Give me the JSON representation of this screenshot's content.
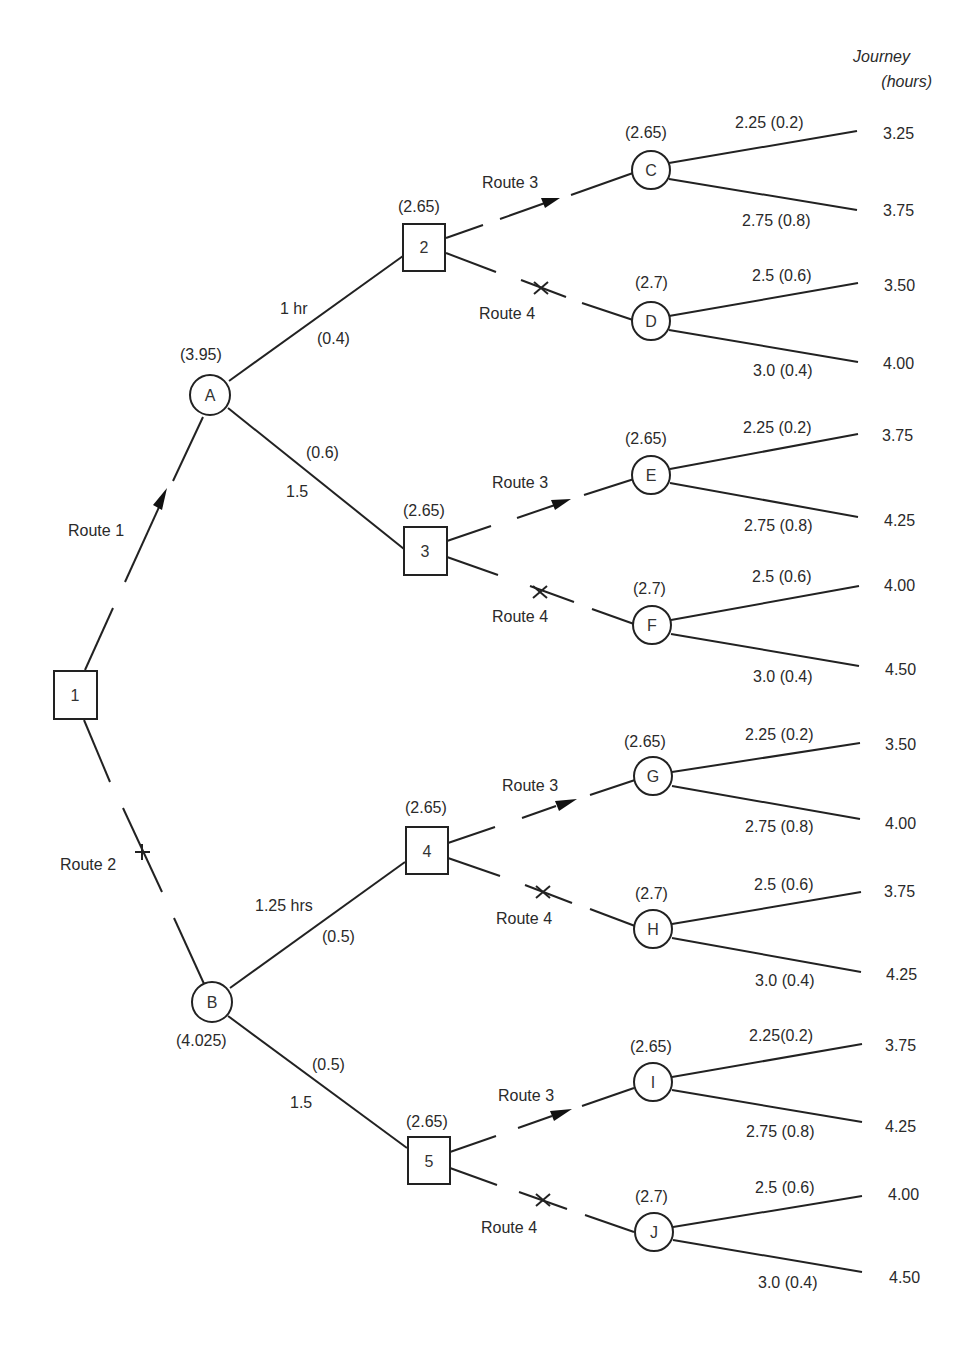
{
  "header": {
    "journey_label": "Journey",
    "hours_label": "(hours)"
  },
  "decision_nodes": [
    {
      "id": "1",
      "label": "1",
      "value": ""
    },
    {
      "id": "2",
      "label": "2",
      "value": "(2.65)"
    },
    {
      "id": "3",
      "label": "3",
      "value": "(2.65)"
    },
    {
      "id": "4",
      "label": "4",
      "value": "(2.65)"
    },
    {
      "id": "5",
      "label": "5",
      "value": "(2.65)"
    }
  ],
  "chance_nodes": [
    {
      "id": "A",
      "label": "A",
      "value": "(3.95)"
    },
    {
      "id": "B",
      "label": "B",
      "value": "(4.025)"
    },
    {
      "id": "C",
      "label": "C",
      "value": "(2.65)"
    },
    {
      "id": "D",
      "label": "D",
      "value": "(2.7)"
    },
    {
      "id": "E",
      "label": "E",
      "value": "(2.65)"
    },
    {
      "id": "F",
      "label": "F",
      "value": "(2.7)"
    },
    {
      "id": "G",
      "label": "G",
      "value": "(2.65)"
    },
    {
      "id": "H",
      "label": "H",
      "value": "(2.7)"
    },
    {
      "id": "I",
      "label": "I",
      "value": "(2.65)"
    },
    {
      "id": "J",
      "label": "J",
      "value": "(2.7)"
    }
  ],
  "routes": {
    "route1": "Route 1",
    "route2": "Route 2",
    "route3": "Route 3",
    "route4": "Route 4"
  },
  "first_stage_branches": {
    "A_up_time": "1 hr",
    "A_up_prob": "(0.4)",
    "A_down_prob": "(0.6)",
    "A_down_time": "1.5",
    "B_up_time": "1.25 hrs",
    "B_up_prob": "(0.5)",
    "B_down_prob": "(0.5)",
    "B_down_time": "1.5"
  },
  "outcome_branches": [
    {
      "node": "C",
      "upper": "2.25   (0.2)",
      "lower": "2.75 (0.8)",
      "journey_upper": "3.25",
      "journey_lower": "3.75"
    },
    {
      "node": "D",
      "upper": "2.5 (0.6)",
      "lower": "3.0 (0.4)",
      "journey_upper": "3.50",
      "journey_lower": "4.00"
    },
    {
      "node": "E",
      "upper": "2.25 (0.2)",
      "lower": "2.75 (0.8)",
      "journey_upper": "3.75",
      "journey_lower": "4.25"
    },
    {
      "node": "F",
      "upper": "2.5 (0.6)",
      "lower": "3.0 (0.4)",
      "journey_upper": "4.00",
      "journey_lower": "4.50"
    },
    {
      "node": "G",
      "upper": "2.25 (0.2)",
      "lower": "2.75 (0.8)",
      "journey_upper": "3.50",
      "journey_lower": "4.00"
    },
    {
      "node": "H",
      "upper": "2.5 (0.6)",
      "lower": "3.0 (0.4)",
      "journey_upper": "3.75",
      "journey_lower": "4.25"
    },
    {
      "node": "I",
      "upper": "2.25(0.2)",
      "lower": "2.75 (0.8)",
      "journey_upper": "3.75",
      "journey_lower": "4.25"
    },
    {
      "node": "J",
      "upper": "2.5 (0.6)",
      "lower": "3.0 (0.4)",
      "journey_upper": "4.00",
      "journey_lower": "4.50"
    }
  ]
}
